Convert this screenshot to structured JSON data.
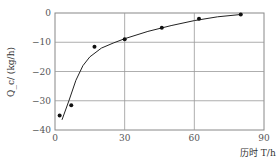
{
  "chart_data": {
    "type": "scatter",
    "title": "",
    "xlabel": "历时 T/h",
    "ylabel": "Q_c/ (kg/h)",
    "xlim": [
      0,
      90
    ],
    "ylim": [
      -40,
      0
    ],
    "xticks": [
      "0",
      "30",
      "60",
      "90"
    ],
    "yticks": [
      "0",
      "−10",
      "−20",
      "−30",
      "−40"
    ],
    "grid": true,
    "legend": null,
    "series": [
      {
        "name": "measured",
        "kind": "scatter",
        "x": [
          2,
          7,
          17,
          30,
          46,
          62,
          80
        ],
        "y": [
          -35,
          -31.5,
          -11.5,
          -9,
          -5,
          -2,
          -0.5
        ]
      },
      {
        "name": "fitted curve",
        "kind": "line",
        "x": [
          3,
          6,
          9,
          12,
          15,
          20,
          25,
          30,
          40,
          50,
          60,
          70,
          80
        ],
        "y": [
          -36.5,
          -30,
          -23,
          -18,
          -15,
          -12,
          -10.3,
          -8.8,
          -6.3,
          -4.3,
          -2.6,
          -1.3,
          -0.5
        ]
      }
    ]
  }
}
